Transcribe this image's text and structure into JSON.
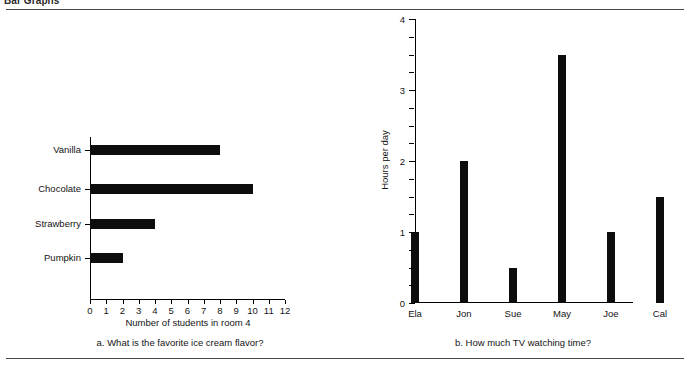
{
  "page": {
    "header_title": "Bar Graphs"
  },
  "chart_data": [
    {
      "id": "favorite-ice-cream-flavor",
      "type": "bar",
      "orientation": "horizontal",
      "title": "",
      "categories": [
        "Vanilla",
        "Chocolate",
        "Strawberry",
        "Pumpkin"
      ],
      "values": [
        8,
        10,
        4,
        2
      ],
      "xlabel": "Number of students in room 4",
      "ylabel": "",
      "xlim": [
        0,
        12
      ],
      "xticks": [
        0,
        1,
        2,
        3,
        4,
        5,
        6,
        7,
        8,
        9,
        10,
        11,
        12
      ],
      "xtick_labels": [
        "0",
        "1",
        "2",
        "3",
        "4",
        "5",
        "6",
        "7",
        "8",
        "9",
        "10",
        "11",
        "12"
      ],
      "grid": false,
      "legend": "none",
      "bar_color": "#0d0d0d",
      "caption": "a.   What is the favorite ice cream flavor?"
    },
    {
      "id": "tv-watching-time",
      "type": "bar",
      "orientation": "vertical",
      "title": "",
      "categories": [
        "Ela",
        "Jon",
        "Sue",
        "May",
        "Joe",
        "Cal"
      ],
      "values": [
        1,
        2,
        0.5,
        3.5,
        1,
        1.5
      ],
      "xlabel": "",
      "ylabel": "Hours per day",
      "ylim": [
        0,
        4
      ],
      "yticks": [
        0,
        0.25,
        0.5,
        0.75,
        1,
        1.25,
        1.5,
        1.75,
        2,
        2.25,
        2.5,
        2.75,
        3,
        3.25,
        3.5,
        3.75,
        4
      ],
      "ytick_labels": [
        "0",
        "",
        "",
        "",
        "1",
        "",
        "",
        "",
        "2",
        "",
        "",
        "",
        "3",
        "",
        "",
        "",
        "4"
      ],
      "ytick_major": [
        0,
        1,
        2,
        3,
        4
      ],
      "grid": false,
      "legend": "none",
      "bar_color": "#0d0d0d",
      "caption": "b.   How much TV watching time?"
    }
  ]
}
